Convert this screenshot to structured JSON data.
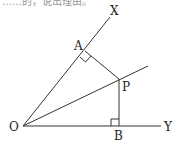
{
  "cropped_top_text": "……的，说出理由。",
  "diagram": {
    "type": "angle bisector geometry",
    "stroke_color": "#333333",
    "points": {
      "O": {
        "label": "O",
        "x": 23,
        "y": 126
      },
      "X": {
        "label": "X",
        "x": 110,
        "y": 17
      },
      "A": {
        "label": "A",
        "x": 85,
        "y": 51
      },
      "P": {
        "label": "P",
        "x": 119,
        "y": 79
      },
      "B": {
        "label": "B",
        "x": 119,
        "y": 126
      },
      "Y": {
        "label": "Y",
        "x": 161,
        "y": 126
      },
      "bisector_end": {
        "x": 148,
        "y": 66
      }
    },
    "segments": [
      "OX",
      "OY",
      "O-bisector",
      "AP",
      "PB"
    ],
    "right_angles": [
      "A",
      "B"
    ]
  }
}
